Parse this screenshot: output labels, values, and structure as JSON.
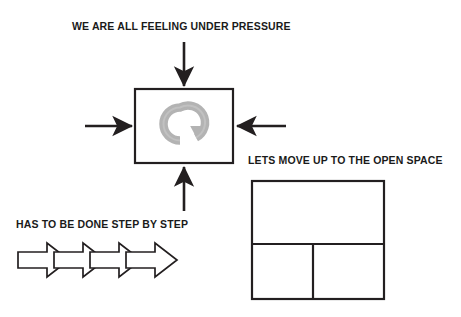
{
  "diagram": {
    "background_color": "#ffffff",
    "stroke_color": "#231f20",
    "text_color": "#1a1a1a",
    "spinner_color": "#b3b3b3"
  },
  "labels": {
    "pressure": "WE ARE ALL FEELING UNDER PRESSURE",
    "open_space": "LETS MOVE UP TO THE OPEN SPACE",
    "step_by_step": "HAS TO BE DONE STEP BY STEP"
  },
  "shapes": {
    "pressure_box": {
      "name": "pressure-box",
      "x": 135,
      "y": 89,
      "width": 98,
      "height": 74,
      "fill": "#ffffff",
      "stroke": "#231f20",
      "stroke_width": 2
    },
    "refresh_spinner": {
      "name": "refresh-spinner-icon",
      "cx": 180,
      "cy": 124,
      "radius": 22,
      "color": "#b3b3b3"
    },
    "arrows_into_box": [
      {
        "name": "arrow-down-top",
        "direction": "down",
        "x1": 184,
        "y1": 42,
        "x2": 184,
        "y2": 88
      },
      {
        "name": "arrow-right-left",
        "direction": "right",
        "x1": 85,
        "y1": 126,
        "x2": 134,
        "y2": 126
      },
      {
        "name": "arrow-left-right",
        "direction": "left",
        "x1": 286,
        "y1": 126,
        "x2": 235,
        "y2": 126
      },
      {
        "name": "arrow-up-bottom",
        "direction": "up",
        "x1": 184,
        "y1": 211,
        "x2": 184,
        "y2": 165
      }
    ],
    "chevron_arrows": {
      "name": "chevron-arrow-chain",
      "count": 4,
      "x": 18,
      "y": 243,
      "total_width": 158,
      "height": 34,
      "fill": "#ffffff",
      "stroke": "#231f20"
    },
    "open_space_grid": {
      "name": "open-space-grid",
      "x": 252,
      "y": 181,
      "width": 132,
      "height": 118,
      "horizontal_divider_y": 244,
      "vertical_divider_x": 313,
      "cells": [
        "top-full-width",
        "bottom-left",
        "bottom-right"
      ],
      "fill": "#ffffff",
      "stroke": "#231f20",
      "stroke_width": 2
    }
  }
}
